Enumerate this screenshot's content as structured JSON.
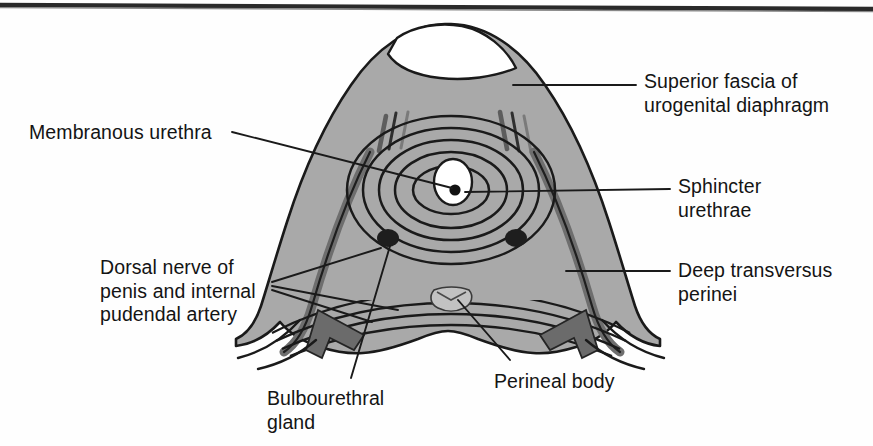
{
  "figure": {
    "scan_rule": "top-border-rule",
    "colors": {
      "background": "#fefefe",
      "paper": "#ffffff",
      "ink": "#141414",
      "muscle_fill": "#a9a9a9",
      "muscle_fill_light": "#b5b5b5",
      "fascia_fill": "#ffffff",
      "dark_band": "#6e6e6e",
      "gland_dark": "#242424",
      "outline": "#1a1a1a",
      "leader": "#1a1a1a"
    }
  },
  "labels": [
    {
      "id": "superior-fascia",
      "text": "Superior fascia of\nurogenital diaphragm",
      "side": "right",
      "x": 644,
      "y": 70
    },
    {
      "id": "sphincter-urethrae",
      "text": "Sphincter\nurethrae",
      "side": "right",
      "x": 678,
      "y": 175
    },
    {
      "id": "deep-transversus-perinei",
      "text": "Deep transversus\nperinei",
      "side": "right",
      "x": 678,
      "y": 259
    },
    {
      "id": "membranous-urethra",
      "text": "Membranous urethra",
      "side": "left",
      "x": 29,
      "y": 121
    },
    {
      "id": "dorsal-nerve-pudendal-artery",
      "text": "Dorsal nerve of\npenis and internal\npudendal artery",
      "side": "left",
      "x": 100,
      "y": 256
    },
    {
      "id": "bulbourethral-gland",
      "text": "Bulbourethral\ngland",
      "side": "left",
      "x": 267,
      "y": 387
    },
    {
      "id": "perineal-body",
      "text": "Perineal body",
      "side": "left",
      "x": 494,
      "y": 370
    }
  ],
  "structures": [
    {
      "id": "urogenital-diaphragm-body",
      "name": "urogenital diaphragm body"
    },
    {
      "id": "superior-fascia-crescent",
      "name": "superior fascia crescent"
    },
    {
      "id": "sphincter-urethrae-rings",
      "name": "sphincter urethrae concentric rings",
      "ring_count": 5
    },
    {
      "id": "membranous-urethra-lumen",
      "name": "membranous urethra lumen"
    },
    {
      "id": "deep-transversus-perinei-fibers",
      "name": "deep transversus perinei fibers",
      "fiber_count": 5
    },
    {
      "id": "perineal-body-node",
      "name": "perineal body"
    },
    {
      "id": "bulbourethral-gland-left",
      "name": "left bulbourethral gland"
    },
    {
      "id": "bulbourethral-gland-right",
      "name": "right bulbourethral gland"
    },
    {
      "id": "neurovascular-band-left",
      "name": "left dorsal nerve and pudendal artery band"
    },
    {
      "id": "neurovascular-band-right",
      "name": "right dorsal nerve and pudendal artery band"
    }
  ]
}
